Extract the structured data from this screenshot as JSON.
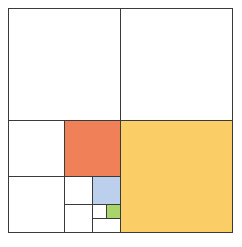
{
  "diagram": {
    "type": "recursive-square-subdivision",
    "outer": {
      "x": 8,
      "y": 8,
      "size": 224
    },
    "line_color": "#3a3a3a",
    "background": "#ffffff",
    "cells": [
      {
        "id": "q-top-left",
        "x": 8,
        "y": 8,
        "w": 112,
        "h": 112,
        "fill": "#ffffff",
        "level": 1
      },
      {
        "id": "q-top-right",
        "x": 120,
        "y": 8,
        "w": 112,
        "h": 112,
        "fill": "#ffffff",
        "level": 1
      },
      {
        "id": "q-bottom-right",
        "x": 120,
        "y": 120,
        "w": 112,
        "h": 112,
        "fill": "#fbcd67",
        "level": 1,
        "highlight": "yellow"
      },
      {
        "id": "q2-top-left",
        "x": 8,
        "y": 120,
        "w": 56,
        "h": 56,
        "fill": "#ffffff",
        "level": 2
      },
      {
        "id": "q2-top-right",
        "x": 64,
        "y": 120,
        "w": 56,
        "h": 56,
        "fill": "#f08058",
        "level": 2,
        "highlight": "orange-red"
      },
      {
        "id": "q2-bottom-left",
        "x": 8,
        "y": 176,
        "w": 56,
        "h": 56,
        "fill": "#ffffff",
        "level": 2
      },
      {
        "id": "q3-top-left",
        "x": 64,
        "y": 176,
        "w": 28,
        "h": 28,
        "fill": "#ffffff",
        "level": 3
      },
      {
        "id": "q3-top-right",
        "x": 92,
        "y": 176,
        "w": 28,
        "h": 28,
        "fill": "#bcd0ee",
        "level": 3,
        "highlight": "blue"
      },
      {
        "id": "q3-bottom-left",
        "x": 64,
        "y": 204,
        "w": 28,
        "h": 28,
        "fill": "#ffffff",
        "level": 3
      },
      {
        "id": "q4-top-left",
        "x": 92,
        "y": 204,
        "w": 14,
        "h": 14,
        "fill": "#ffffff",
        "level": 4
      },
      {
        "id": "q4-top-right",
        "x": 106,
        "y": 204,
        "w": 14,
        "h": 14,
        "fill": "#a8d46a",
        "level": 4,
        "highlight": "green"
      },
      {
        "id": "q4-bottom-strip",
        "x": 92,
        "y": 218,
        "w": 28,
        "h": 14,
        "fill": "#ffffff",
        "level": 4
      }
    ]
  }
}
